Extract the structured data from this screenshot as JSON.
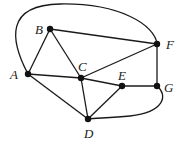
{
  "graph": {
    "nodes": [
      {
        "id": "A",
        "label": "A",
        "x": 28,
        "y": 74,
        "lx": 10,
        "ly": 79
      },
      {
        "id": "B",
        "label": "B",
        "x": 50,
        "y": 29,
        "lx": 35,
        "ly": 34
      },
      {
        "id": "C",
        "label": "C",
        "x": 81,
        "y": 78,
        "lx": 78,
        "ly": 71
      },
      {
        "id": "D",
        "label": "D",
        "x": 88,
        "y": 119,
        "lx": 84,
        "ly": 138
      },
      {
        "id": "E",
        "label": "E",
        "x": 122,
        "y": 86,
        "lx": 118,
        "ly": 80
      },
      {
        "id": "F",
        "label": "F",
        "x": 157,
        "y": 44,
        "lx": 166,
        "ly": 49
      },
      {
        "id": "G",
        "label": "G",
        "x": 157,
        "y": 86,
        "lx": 164,
        "ly": 92
      }
    ],
    "edges": [
      {
        "from": "A",
        "to": "B"
      },
      {
        "from": "B",
        "to": "C"
      },
      {
        "from": "B",
        "to": "F"
      },
      {
        "from": "A",
        "to": "C"
      },
      {
        "from": "C",
        "to": "F"
      },
      {
        "from": "C",
        "to": "E"
      },
      {
        "from": "C",
        "to": "D"
      },
      {
        "from": "A",
        "to": "D"
      },
      {
        "from": "D",
        "to": "E"
      },
      {
        "from": "E",
        "to": "G"
      },
      {
        "from": "F",
        "to": "G"
      },
      {
        "from": "A",
        "to": "F",
        "curved": true
      },
      {
        "from": "G",
        "to": "D",
        "curved": true
      }
    ]
  }
}
